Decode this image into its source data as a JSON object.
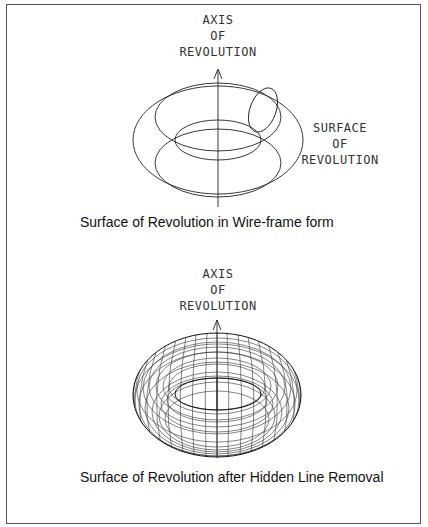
{
  "figure_top": {
    "axis_label": [
      "AXIS",
      "OF",
      "REVOLUTION"
    ],
    "surface_label": [
      "SURFACE",
      "OF",
      "REVOLUTION"
    ],
    "caption": "Surface of Revolution in Wire-frame form"
  },
  "figure_bottom": {
    "axis_label": [
      "AXIS",
      "OF",
      "REVOLUTION"
    ],
    "caption": "Surface of Revolution after Hidden Line Removal"
  },
  "colors": {
    "line": "#222222",
    "frame": "#555555",
    "background": "#ffffff"
  }
}
